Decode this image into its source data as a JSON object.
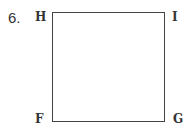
{
  "problem": {
    "number": "6.",
    "shape": "square",
    "vertices": {
      "top_left": "H",
      "top_right": "I",
      "bottom_left": "F",
      "bottom_right": "G"
    },
    "stroke_color": "#444444"
  }
}
